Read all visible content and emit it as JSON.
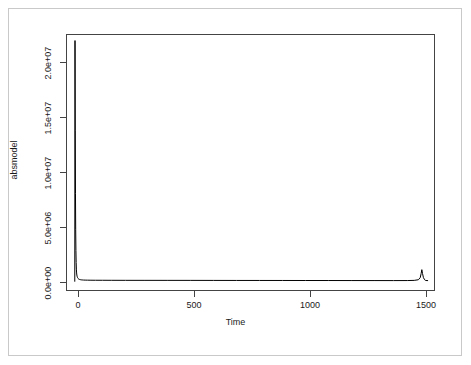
{
  "chart_data": {
    "type": "line",
    "title": "",
    "subtitle": "",
    "xlabel": "Time",
    "ylabel": "absmodel",
    "xlim": [
      -38,
      1560
    ],
    "ylim": [
      -700000,
      22800000
    ],
    "grid": false,
    "legend": null,
    "xticks": [
      0,
      500,
      1000,
      1500
    ],
    "xticklabels": [
      "0",
      "500",
      "1000",
      "1500"
    ],
    "yticks": [
      0,
      5000000,
      10000000,
      15000000,
      20000000
    ],
    "yticklabels": [
      "0.0e+00",
      "5.0e+06",
      "1.0e+07",
      "1.5e+07",
      "2.0e+07"
    ],
    "line_color": "#000000",
    "series": [
      {
        "name": "absmodel",
        "x": [
          0,
          1,
          2,
          3,
          4,
          5,
          6,
          7,
          8,
          9,
          10,
          12,
          14,
          16,
          18,
          20,
          24,
          28,
          32,
          38,
          45,
          55,
          70,
          90,
          120,
          160,
          220,
          300,
          400,
          500,
          600,
          700,
          800,
          900,
          1000,
          1100,
          1200,
          1300,
          1380,
          1440,
          1470,
          1488,
          1496,
          1500,
          1503,
          1506,
          1510,
          1515,
          1520,
          1530
        ],
        "y": [
          150000,
          22200000,
          14000000,
          8200000,
          4900000,
          3000000,
          1900000,
          1300000,
          950000,
          760000,
          650000,
          520000,
          450000,
          410000,
          380000,
          360000,
          335000,
          320000,
          310000,
          300000,
          295000,
          290000,
          285000,
          282000,
          280000,
          278000,
          276000,
          274000,
          272000,
          270000,
          268000,
          266000,
          264000,
          262000,
          260000,
          258000,
          256000,
          254000,
          252000,
          255000,
          270000,
          330000,
          520000,
          900000,
          1250000,
          900000,
          520000,
          330000,
          260000,
          250000
        ]
      }
    ]
  },
  "axis": {
    "y_title": "absmodel",
    "x_title": "Time"
  }
}
